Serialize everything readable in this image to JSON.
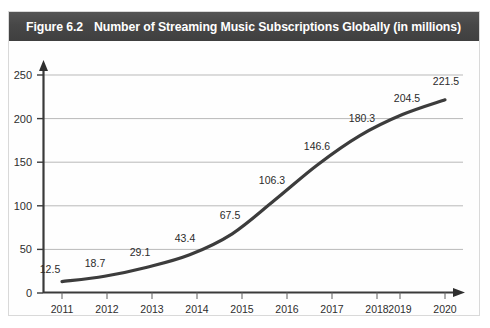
{
  "figure": {
    "label": "Figure 6.2",
    "title": "Number of Streaming Music Subscriptions Globally (in millions)",
    "band_color": "#464646",
    "band_text_color": "#ffffff",
    "frame_color": "#d9d9d9",
    "background": "#ffffff"
  },
  "chart_data": {
    "type": "line",
    "title": "Number of Streaming Music Subscriptions Globally (in millions)",
    "xlabel": "",
    "ylabel": "",
    "categories": [
      "2011",
      "2012",
      "2013",
      "2014",
      "2015",
      "2016",
      "2017",
      "2018",
      "2019",
      "2020"
    ],
    "values": [
      12.5,
      18.7,
      29.1,
      43.4,
      67.5,
      106.3,
      146.6,
      180.3,
      204.5,
      221.5
    ],
    "point_labels": [
      "12.5",
      "18.7",
      "29.1",
      "43.4",
      "67.5",
      "106.3",
      "146.6",
      "180.3",
      "204.5",
      "221.5"
    ],
    "yticks": [
      0,
      50,
      100,
      150,
      200,
      250
    ],
    "ytick_labels": [
      "0",
      "50",
      "100",
      "150",
      "200",
      "250"
    ],
    "ylim": [
      0,
      250
    ],
    "grid": true,
    "grid_color": "#b8b8b8",
    "legend": "none",
    "series_color": "#3c3c3c",
    "axis_color": "#3a3a3a",
    "series_name": "Streaming music subscriptions (millions)",
    "x_axis_arrow": true,
    "y_axis_arrow": true
  }
}
